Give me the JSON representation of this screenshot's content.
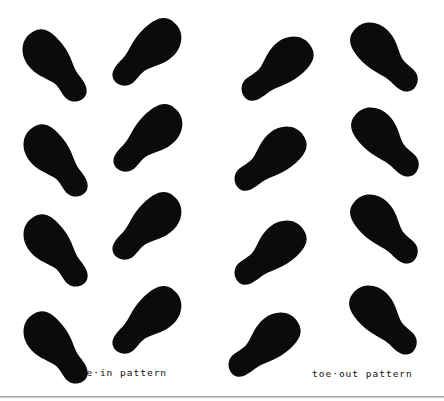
{
  "figure": {
    "ink_color": "#0b0b0b",
    "background": "#ffffff",
    "patterns": [
      {
        "name": "toe-in",
        "label": "toe·in pattern",
        "footprints": [
          {
            "foot": "left",
            "cx": 54,
            "cy": 66,
            "angle": -38
          },
          {
            "foot": "right",
            "cx": 148,
            "cy": 53,
            "angle": 45
          },
          {
            "foot": "left",
            "cx": 55,
            "cy": 161,
            "angle": -38
          },
          {
            "foot": "right",
            "cx": 149,
            "cy": 139,
            "angle": 45
          },
          {
            "foot": "left",
            "cx": 55,
            "cy": 251,
            "angle": -38
          },
          {
            "foot": "right",
            "cx": 148,
            "cy": 227,
            "angle": 45
          },
          {
            "foot": "left",
            "cx": 55,
            "cy": 348,
            "angle": -38
          },
          {
            "foot": "right",
            "cx": 148,
            "cy": 321,
            "angle": 45
          }
        ]
      },
      {
        "name": "toe-out",
        "label": "toe·out pattern",
        "footprints": [
          {
            "foot": "left",
            "cx": 277,
            "cy": 68,
            "angle": 52
          },
          {
            "foot": "right",
            "cx": 385,
            "cy": 56,
            "angle": -45
          },
          {
            "foot": "left",
            "cx": 270,
            "cy": 158,
            "angle": 52
          },
          {
            "foot": "right",
            "cx": 386,
            "cy": 141,
            "angle": -45
          },
          {
            "foot": "left",
            "cx": 270,
            "cy": 252,
            "angle": 52
          },
          {
            "foot": "right",
            "cx": 385,
            "cy": 228,
            "angle": -45
          },
          {
            "foot": "left",
            "cx": 264,
            "cy": 344,
            "angle": 52
          },
          {
            "foot": "right",
            "cx": 384,
            "cy": 319,
            "angle": -45
          }
        ]
      }
    ]
  }
}
